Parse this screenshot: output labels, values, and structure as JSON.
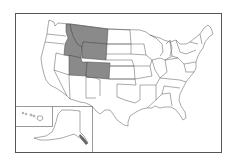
{
  "map": {
    "title": "United States map with Mountain West states highlighted",
    "highlight_color": "#8a8a8a",
    "state_fill": "#ffffff",
    "border_color": "#555555",
    "highlighted_states": [
      "Montana",
      "Idaho",
      "Wyoming",
      "Utah",
      "Colorado"
    ],
    "insets": [
      "Alaska",
      "Hawaii"
    ]
  }
}
